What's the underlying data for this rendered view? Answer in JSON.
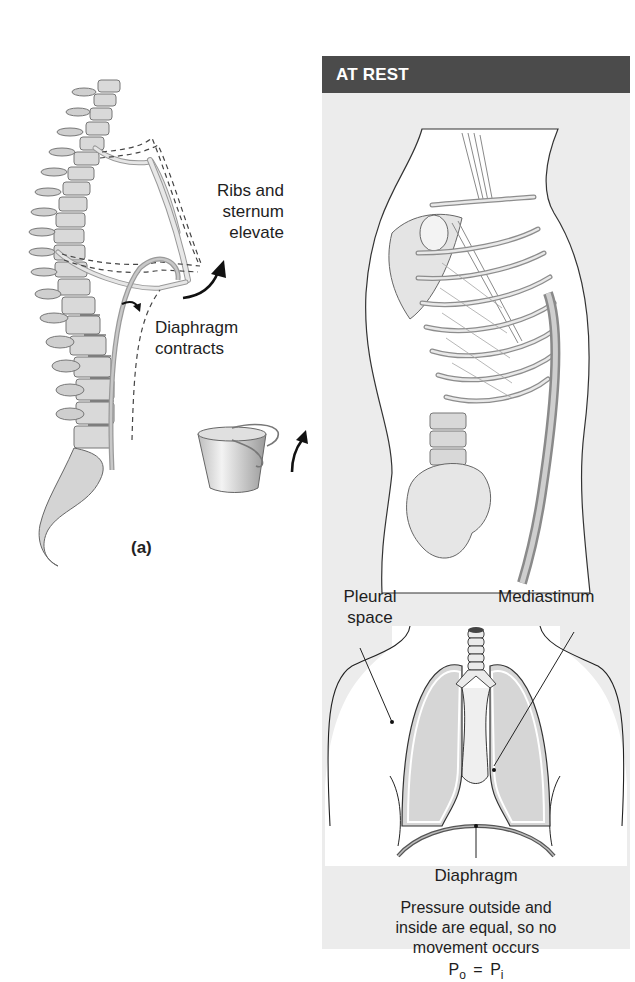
{
  "figure_a": {
    "label_ribs": [
      "Ribs and",
      "sternum",
      "elevate"
    ],
    "label_diaphragm": [
      "Diaphragm",
      "contracts"
    ],
    "panel_label": "(a)",
    "icons": [
      "spine-ribcage-illustration",
      "bucket-handle-icon",
      "curved-arrow-icon"
    ]
  },
  "panel": {
    "header": "AT REST",
    "header_color": "#4b4b4b",
    "background_color": "#ececec",
    "torso_illustration": "lateral-thorax-muscles-illustration",
    "lungs_diagram": {
      "label_pleural": [
        "Pleural",
        "space"
      ],
      "label_mediastinum": "Mediastinum",
      "label_diaphragm": "Diaphragm"
    },
    "caption": [
      "Pressure outside and",
      "inside are equal, so no",
      "movement occurs"
    ],
    "equation": {
      "lhs": "P",
      "lhs_sub": "o",
      "op": "=",
      "rhs": "P",
      "rhs_sub": "i"
    }
  }
}
